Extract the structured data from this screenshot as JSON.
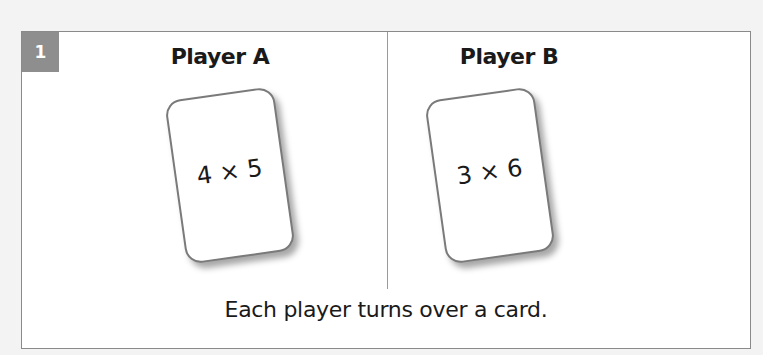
{
  "step": {
    "number": "1",
    "caption": "Each player turns over a card."
  },
  "players": [
    {
      "name": "Player A",
      "card": "4 × 5"
    },
    {
      "name": "Player B",
      "card": "3 × 6"
    }
  ],
  "colors": {
    "badge": "#8e8e8e",
    "border": "#8a8a8a",
    "background": "#f3f3f3"
  }
}
